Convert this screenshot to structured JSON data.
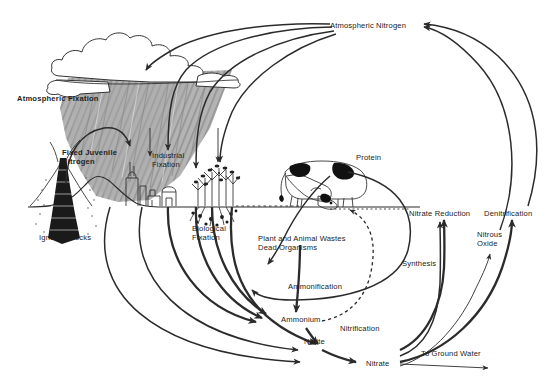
{
  "diagram": {
    "type": "cycle-diagram",
    "background_color": "#ffffff",
    "ink_color": "#2b2b2b",
    "shade_color": "#a8a8a8"
  },
  "labels": {
    "atmospheric_nitrogen": "Atmospheric Nitrogen",
    "atmospheric_fixation": "Atmospheric Fixation",
    "fixed_juvenile_nitrogen_line1": "Fixed Juvenile",
    "fixed_juvenile_nitrogen_line2": "Nitrogen",
    "industrial_fixation_line1": "Industrial",
    "industrial_fixation_line2": "Fixation",
    "biological_fixation_line1": "Biological",
    "biological_fixation_line2": "Fixation",
    "igneous_rocks": "Igneous Rocks",
    "protein": "Protein",
    "plant_animal_wastes_line1": "Plant and Animal Wastes",
    "plant_animal_wastes_line2": "Dead Organisms",
    "ammonification": "Ammonification",
    "ammonium": "Ammonium",
    "nitrite": "Nitrite",
    "nitrification": "Nitrification",
    "nitrate": "Nitrate",
    "synthesis": "Synthesis",
    "nitrate_reduction": "Nitrate Reduction",
    "denitrification": "Denitrification",
    "nitrous_oxide_line1": "Nitrous",
    "nitrous_oxide_line2": "Oxide",
    "to_ground_water": "To Ground Water"
  },
  "pools": [
    "Atmospheric Nitrogen",
    "Igneous Rocks",
    "Protein",
    "Plant and Animal Wastes Dead Organisms",
    "Ammonium",
    "Nitrite",
    "Nitrate",
    "Nitrous Oxide"
  ],
  "processes": [
    "Atmospheric Fixation",
    "Fixed Juvenile Nitrogen",
    "Industrial Fixation",
    "Biological Fixation",
    "Ammonification",
    "Nitrification",
    "Synthesis",
    "Nitrate Reduction",
    "Denitrification",
    "To Ground Water"
  ],
  "scene_objects": [
    "cloud",
    "rain-shading",
    "volcano",
    "factory",
    "legume-plant",
    "cow",
    "ground-line"
  ]
}
